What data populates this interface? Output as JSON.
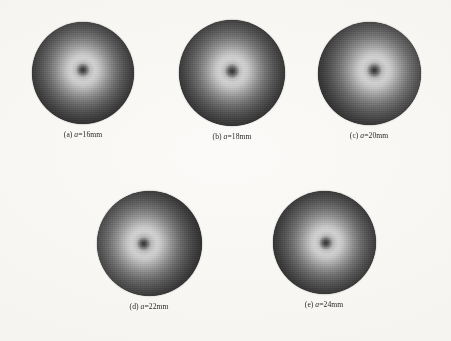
{
  "figure": {
    "kind": "multi-panel-image-figure",
    "background_color": "#f8f7f4",
    "top_cropped_line": "· · ·",
    "panels": [
      {
        "id": "panel-a",
        "label_prefix": "(a)",
        "symbol": "a",
        "equals": "=",
        "value": "16mm",
        "caption": "(a) a=16mm",
        "row": 1,
        "column": 1,
        "left": 8,
        "top": 22,
        "disk_size": 102,
        "center_x": "50%",
        "center_y": "47%"
      },
      {
        "id": "panel-b",
        "label_prefix": "(b)",
        "symbol": "a",
        "equals": "=",
        "value": "18mm",
        "caption": "(b) a=18mm",
        "row": 1,
        "column": 2,
        "left": 157,
        "top": 20,
        "disk_size": 106,
        "center_x": "50%",
        "center_y": "48%"
      },
      {
        "id": "panel-c",
        "label_prefix": "(c)",
        "symbol": "a",
        "equals": "=",
        "value": "20mm",
        "caption": "(c) a=20mm",
        "row": 1,
        "column": 3,
        "left": 294,
        "top": 22,
        "disk_size": 103,
        "center_x": "55%",
        "center_y": "47%"
      },
      {
        "id": "panel-d",
        "label_prefix": "(d)",
        "symbol": "a",
        "equals": "=",
        "value": "22mm",
        "caption": "(d) a=22mm",
        "row": 2,
        "column": 1,
        "left": 74,
        "top": 191,
        "disk_size": 105,
        "center_x": "45%",
        "center_y": "50%"
      },
      {
        "id": "panel-e",
        "label_prefix": "(e)",
        "symbol": "a",
        "equals": "=",
        "value": "24mm",
        "caption": "(e) a=24mm",
        "row": 2,
        "column": 2,
        "left": 249,
        "top": 191,
        "disk_size": 103,
        "center_x": "52%",
        "center_y": "50%"
      }
    ],
    "colors": {
      "paper": "#f8f7f4",
      "caption_text": "#2a2a2a",
      "disk_rim": "#141414",
      "disk_ring_peak": "#cfcfcf",
      "disk_core_dot": "#282828"
    }
  }
}
